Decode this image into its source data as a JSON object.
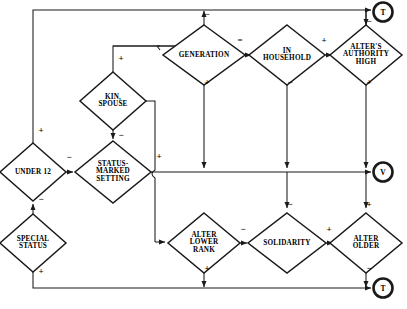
{
  "diagram": {
    "canvas": {
      "width": 407,
      "height": 309,
      "background": "#ffffff",
      "line_color": "#1a1a1a"
    },
    "nodes": [
      {
        "id": "under12",
        "label": "UNDER 12",
        "cx": 33,
        "cy": 172,
        "rx": 33,
        "ry": 29,
        "font_size": 7.2
      },
      {
        "id": "special",
        "label": "SPECIAL\nSTATUS",
        "cx": 33,
        "cy": 243,
        "rx": 33,
        "ry": 29,
        "font_size": 7.2
      },
      {
        "id": "status_marked",
        "label": "STATUS-\nMARKED\nSETTING",
        "cx": 113,
        "cy": 172,
        "rx": 38,
        "ry": 31,
        "font_size": 7.2
      },
      {
        "id": "kin_spouse",
        "label": "KIN,\nSPOUSE",
        "cx": 113,
        "cy": 101,
        "rx": 33,
        "ry": 29,
        "font_size": 7.2
      },
      {
        "id": "generation",
        "label": "GENERATION",
        "cx": 204,
        "cy": 55,
        "rx": 41,
        "ry": 30,
        "font_size": 7.2
      },
      {
        "id": "in_household",
        "label": "IN\nHOUSEHOLD",
        "cx": 287,
        "cy": 55,
        "rx": 38,
        "ry": 30,
        "font_size": 7.2
      },
      {
        "id": "alter_auth",
        "label": "ALTER'S\nAUTHORITY\nHIGH",
        "cx": 366,
        "cy": 55,
        "rx": 36,
        "ry": 30,
        "font_size": 7.2
      },
      {
        "id": "alter_lower",
        "label": "ALTER\nLOWER\nRANK",
        "cx": 204,
        "cy": 243,
        "rx": 36,
        "ry": 30,
        "font_size": 7.2
      },
      {
        "id": "solidarity",
        "label": "SOLIDARITY",
        "cx": 287,
        "cy": 243,
        "rx": 39,
        "ry": 30,
        "font_size": 7.2
      },
      {
        "id": "alter_older",
        "label": "ALTER\nOLDER",
        "cx": 366,
        "cy": 243,
        "rx": 36,
        "ry": 30,
        "font_size": 7.2
      }
    ],
    "terminals": [
      {
        "id": "term_t_top",
        "label": "T",
        "cx": 383,
        "cy": 12,
        "r": 10,
        "font_size": 7.5
      },
      {
        "id": "term_v_mid",
        "label": "V",
        "cx": 383,
        "cy": 172,
        "r": 10,
        "font_size": 7.5
      },
      {
        "id": "term_t_bottom",
        "label": "T",
        "cx": 383,
        "cy": 288,
        "r": 10,
        "font_size": 7.5
      }
    ],
    "edge_signs": [
      {
        "id": "sign-under12-top",
        "text": "+",
        "x": 41,
        "y": 131
      },
      {
        "id": "sign-under12-to-status",
        "text": "−",
        "x": 69,
        "y": 158
      },
      {
        "id": "sign-special-to-under12",
        "text": "−",
        "x": 41,
        "y": 200
      },
      {
        "id": "sign-special-bottom",
        "text": "+",
        "x": 41,
        "y": 272
      },
      {
        "id": "sign-kin-to-status",
        "text": "−",
        "x": 121,
        "y": 136
      },
      {
        "id": "sign-kin-to-generation",
        "text": "+",
        "x": 121,
        "y": 59
      },
      {
        "id": "sign-status-right",
        "text": "+",
        "x": 159,
        "y": 157
      },
      {
        "id": "sign-generation-top",
        "text": "−",
        "x": 207,
        "y": 15
      },
      {
        "id": "sign-generation-bottom",
        "text": "+",
        "x": 207,
        "y": 83
      },
      {
        "id": "sign-generation-household",
        "text": "=",
        "x": 240,
        "y": 41
      },
      {
        "id": "sign-household-alter",
        "text": "+",
        "x": 324,
        "y": 41
      },
      {
        "id": "sign-household-bottom",
        "text": "−",
        "x": 290,
        "y": 83
      },
      {
        "id": "sign-alterauth-top",
        "text": "−",
        "x": 369,
        "y": 22
      },
      {
        "id": "sign-alterauth-bottom",
        "text": "+",
        "x": 369,
        "y": 83
      },
      {
        "id": "sign-alterlower-bottom",
        "text": "+",
        "x": 207,
        "y": 269
      },
      {
        "id": "sign-alterlower-solidarity",
        "text": "−",
        "x": 243,
        "y": 230
      },
      {
        "id": "sign-solidarity-top",
        "text": "−",
        "x": 290,
        "y": 205
      },
      {
        "id": "sign-solidarity-alterolder",
        "text": "+",
        "x": 329,
        "y": 230
      },
      {
        "id": "sign-alterolder-top",
        "text": "+",
        "x": 369,
        "y": 205
      },
      {
        "id": "sign-alterolder-bottom",
        "text": "−",
        "x": 369,
        "y": 269
      }
    ]
  }
}
